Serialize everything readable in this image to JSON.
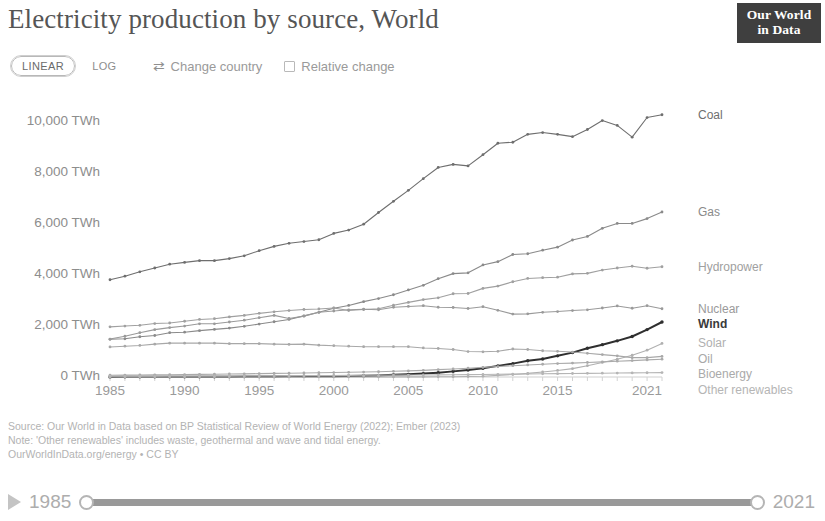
{
  "header": {
    "title": "Electricity production by source, World",
    "logo_line1": "Our World",
    "logo_line2": "in Data"
  },
  "controls": {
    "scale_linear": "LINEAR",
    "scale_log": "LOG",
    "change_country": "Change country",
    "change_country_icon": "swap-arrows-icon",
    "relative_change": "Relative change",
    "relative_change_checked": false,
    "active_scale": "LINEAR"
  },
  "footer": {
    "source": "Source: Our World in Data based on BP Statistical Review of World Energy (2022); Ember (2023)",
    "note": "Note: 'Other renewables' includes waste, geothermal and wave and tidal energy.",
    "license": "OurWorldInData.org/energy • CC BY"
  },
  "timeline": {
    "play_icon": "play-icon",
    "start_year": "1985",
    "end_year": "2021"
  },
  "chart_data": {
    "type": "line",
    "title": "Electricity production by source, World",
    "xlabel": "",
    "ylabel": "TWh",
    "unit": "TWh",
    "grid": false,
    "legend_position": "right-of-lines",
    "xlim": [
      1985,
      2022
    ],
    "ylim": [
      0,
      10800
    ],
    "x_ticks": [
      1985,
      1990,
      1995,
      2000,
      2005,
      2010,
      2015,
      2021
    ],
    "x_tick_labels": [
      "1985",
      "1990",
      "1995",
      "2000",
      "2005",
      "2010",
      "2015",
      "2021"
    ],
    "y_ticks": [
      0,
      2000,
      4000,
      6000,
      8000,
      10000
    ],
    "y_tick_labels": [
      "0 TWh",
      "2,000 TWh",
      "4,000 TWh",
      "6,000 TWh",
      "8,000 TWh",
      "10,000 TWh"
    ],
    "x": [
      1985,
      1986,
      1987,
      1988,
      1989,
      1990,
      1991,
      1992,
      1993,
      1994,
      1995,
      1996,
      1997,
      1998,
      1999,
      2000,
      2001,
      2002,
      2003,
      2004,
      2005,
      2006,
      2007,
      2008,
      2009,
      2010,
      2011,
      2012,
      2013,
      2014,
      2015,
      2016,
      2017,
      2018,
      2019,
      2020,
      2021,
      2022
    ],
    "series": [
      {
        "name": "Coal",
        "label": "Coal",
        "color": "#6e6e6e",
        "emphasis": false,
        "values": [
          3820,
          3960,
          4130,
          4280,
          4430,
          4500,
          4570,
          4570,
          4650,
          4760,
          4960,
          5130,
          5250,
          5320,
          5390,
          5640,
          5770,
          6000,
          6460,
          6900,
          7330,
          7790,
          8230,
          8350,
          8290,
          8730,
          9180,
          9220,
          9530,
          9600,
          9530,
          9440,
          9720,
          10070,
          9880,
          9420,
          10190,
          10300
        ]
      },
      {
        "name": "Gas",
        "label": "Gas",
        "color": "#8a8a8a",
        "emphasis": false,
        "values": [
          1480,
          1500,
          1580,
          1630,
          1740,
          1760,
          1820,
          1870,
          1920,
          1990,
          2080,
          2170,
          2260,
          2400,
          2540,
          2700,
          2810,
          2960,
          3080,
          3230,
          3420,
          3600,
          3860,
          4060,
          4090,
          4400,
          4530,
          4810,
          4840,
          4980,
          5100,
          5380,
          5520,
          5840,
          6030,
          6030,
          6220,
          6480
        ]
      },
      {
        "name": "Hydropower",
        "label": "Hydropower",
        "color": "#a0a0a0",
        "emphasis": false,
        "values": [
          1970,
          2000,
          2030,
          2100,
          2120,
          2190,
          2260,
          2290,
          2360,
          2420,
          2500,
          2560,
          2610,
          2650,
          2670,
          2710,
          2610,
          2650,
          2680,
          2820,
          2930,
          3040,
          3110,
          3270,
          3280,
          3480,
          3570,
          3740,
          3870,
          3900,
          3920,
          4050,
          4070,
          4200,
          4280,
          4350,
          4270,
          4330
        ]
      },
      {
        "name": "Nuclear",
        "label": "Nuclear",
        "color": "#9a9a9a",
        "emphasis": false,
        "values": [
          1490,
          1600,
          1740,
          1860,
          1940,
          2000,
          2090,
          2090,
          2160,
          2230,
          2330,
          2420,
          2300,
          2390,
          2540,
          2590,
          2640,
          2660,
          2640,
          2740,
          2770,
          2800,
          2740,
          2730,
          2690,
          2760,
          2620,
          2470,
          2480,
          2540,
          2570,
          2610,
          2640,
          2710,
          2790,
          2700,
          2800,
          2680
        ]
      },
      {
        "name": "Wind",
        "label": "Wind",
        "color": "#2f2f2f",
        "emphasis": true,
        "values": [
          4,
          5,
          6,
          7,
          8,
          9,
          10,
          12,
          14,
          17,
          21,
          22,
          26,
          33,
          43,
          31,
          38,
          52,
          63,
          85,
          104,
          133,
          171,
          221,
          276,
          342,
          437,
          525,
          636,
          706,
          831,
          958,
          1129,
          1270,
          1420,
          1591,
          1862,
          2160
        ]
      },
      {
        "name": "Solar",
        "label": "Solar",
        "color": "#b0b0b0",
        "emphasis": false,
        "values": [
          0,
          0,
          0,
          0,
          0,
          0,
          0,
          0,
          0,
          0,
          0,
          1,
          1,
          1,
          1,
          1,
          1,
          2,
          2,
          3,
          4,
          5,
          7,
          12,
          20,
          32,
          64,
          99,
          141,
          197,
          258,
          328,
          445,
          572,
          700,
          855,
          1054,
          1320
        ]
      },
      {
        "name": "Oil",
        "label": "Oil",
        "color": "#a8a8a8",
        "emphasis": false,
        "values": [
          1180,
          1210,
          1240,
          1290,
          1330,
          1330,
          1330,
          1330,
          1310,
          1310,
          1310,
          1290,
          1280,
          1290,
          1250,
          1230,
          1210,
          1190,
          1190,
          1190,
          1190,
          1140,
          1120,
          1080,
          1000,
          990,
          1010,
          1100,
          1080,
          1030,
          1010,
          980,
          930,
          880,
          830,
          760,
          760,
          810
        ]
      },
      {
        "name": "Bioenergy",
        "label": "Bioenergy",
        "color": "#aaaaaa",
        "emphasis": false,
        "values": [
          68,
          72,
          78,
          84,
          90,
          97,
          104,
          110,
          117,
          124,
          134,
          142,
          150,
          158,
          166,
          174,
          184,
          195,
          208,
          223,
          240,
          262,
          288,
          314,
          345,
          377,
          410,
          443,
          474,
          501,
          528,
          546,
          570,
          595,
          620,
          644,
          672,
          700
        ]
      },
      {
        "name": "Other renewables",
        "label": "Other renewables",
        "color": "#b5b5b5",
        "emphasis": false,
        "values": [
          30,
          32,
          34,
          36,
          38,
          40,
          42,
          44,
          46,
          48,
          50,
          52,
          54,
          56,
          58,
          60,
          63,
          66,
          69,
          72,
          76,
          80,
          85,
          90,
          95,
          101,
          107,
          113,
          119,
          125,
          131,
          137,
          143,
          149,
          155,
          161,
          167,
          173
        ]
      }
    ]
  }
}
